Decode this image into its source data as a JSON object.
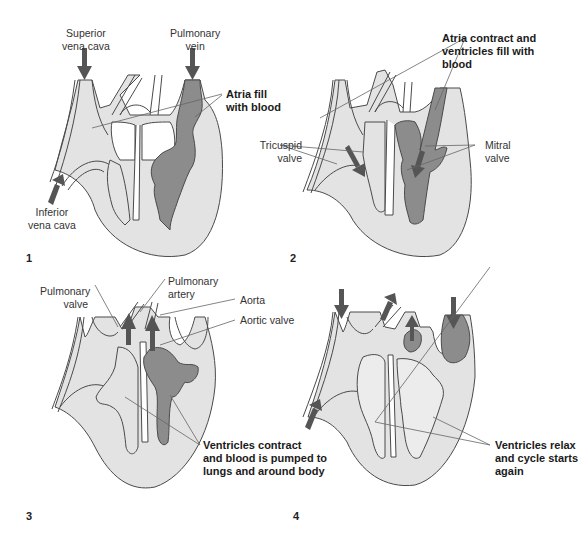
{
  "colors": {
    "light_fill": "#e3e3e3",
    "dark_fill": "#8c8c8c",
    "stroke": "#4a4a4a",
    "arrow": "#555555",
    "leader": "#666666"
  },
  "panels": [
    {
      "number": "1",
      "caption": [
        "Atria fill",
        "with blood"
      ],
      "labels": {
        "superior_vena_cava": [
          "Superior",
          "vena cava"
        ],
        "pulmonary_vein": [
          "Pulmonary",
          "vein"
        ],
        "inferior_vena_cava": [
          "Inferior",
          "vena cava"
        ]
      }
    },
    {
      "number": "2",
      "caption": [
        "Atria contract and",
        "ventricles fill with",
        "blood"
      ],
      "labels": {
        "tricuspid_valve": [
          "Tricuspid",
          "valve"
        ],
        "mitral_valve": [
          "Mitral",
          "valve"
        ]
      }
    },
    {
      "number": "3",
      "caption": [
        "Ventricles contract",
        "and blood is pumped to",
        "lungs and around body"
      ],
      "labels": {
        "pulmonary_valve": [
          "Pulmonary",
          "valve"
        ],
        "pulmonary_artery": [
          "Pulmonary",
          "artery"
        ],
        "aorta": "Aorta",
        "aortic_valve": "Aortic valve"
      }
    },
    {
      "number": "4",
      "caption": [
        "Ventricles relax",
        "and cycle starts",
        "again"
      ],
      "labels": {}
    }
  ]
}
